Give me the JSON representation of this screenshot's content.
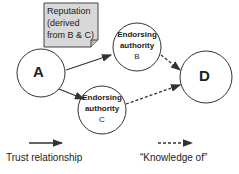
{
  "diagram": {
    "callout": {
      "lines": [
        "Reputation",
        "(derived",
        "from B & C)"
      ]
    },
    "nodes": {
      "a": {
        "label": "A"
      },
      "b": {
        "lines": [
          "Endorsing",
          "authority",
          "B"
        ]
      },
      "c": {
        "lines": [
          "Endorsing",
          "authority",
          "C"
        ]
      },
      "d": {
        "label": "D"
      }
    },
    "legend": {
      "trust": "Trust relationship",
      "knowledge": "“Knowledge of”"
    }
  }
}
